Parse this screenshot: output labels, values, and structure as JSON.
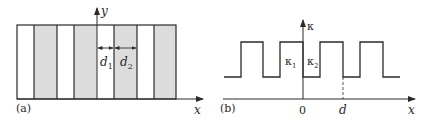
{
  "panel_a": {
    "tag": "(a)",
    "axis_x_label": "x",
    "axis_y_label": "y",
    "d1_label": "d",
    "d1_sub": "1",
    "d2_label": "d",
    "d2_sub": "2",
    "stripe_fill": "#dcdcdc",
    "stripes": [
      {
        "x0": 17,
        "x1": 34,
        "fill": "white"
      },
      {
        "x0": 34,
        "x1": 57,
        "fill": "gray"
      },
      {
        "x0": 57,
        "x1": 74,
        "fill": "white"
      },
      {
        "x0": 74,
        "x1": 97,
        "fill": "gray"
      },
      {
        "x0": 97,
        "x1": 114,
        "fill": "white"
      },
      {
        "x0": 114,
        "x1": 137,
        "fill": "gray"
      },
      {
        "x0": 137,
        "x1": 154,
        "fill": "white"
      },
      {
        "x0": 154,
        "x1": 176,
        "fill": "gray"
      }
    ]
  },
  "panel_b": {
    "tag": "(b)",
    "axis_x_label": "x",
    "axis_y_label": "κ",
    "origin_label": "0",
    "period_label": "d",
    "kappa1_label": "κ",
    "kappa1_sub": "1",
    "kappa2_label": "κ",
    "kappa2_sub": "2"
  },
  "line_color": "#2a2a2a"
}
